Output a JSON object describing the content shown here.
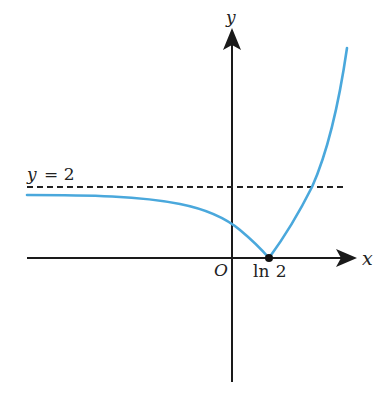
{
  "diagram": {
    "type": "function-graph",
    "axes": {
      "x_label": "x",
      "y_label": "y",
      "origin_label": "O"
    },
    "asymptote": {
      "label": "y = 2",
      "label_var": "y",
      "label_eq": "= 2",
      "style": "dashed",
      "color": "#222222"
    },
    "marked_point": {
      "label": "ln2",
      "label_fn": "ln",
      "label_num": "2",
      "description": "minimum point on x-axis at x = ln2"
    },
    "curve": {
      "color": "#4aa8dc",
      "description": "V-shaped curve: left branch approaches y=2 as x→-∞, decreases to touch x-axis at ln2, right branch rises steeply crossing y=2"
    },
    "colors": {
      "axis": "#1a1a1a",
      "curve": "#4aa8dc",
      "background": "#ffffff"
    }
  }
}
